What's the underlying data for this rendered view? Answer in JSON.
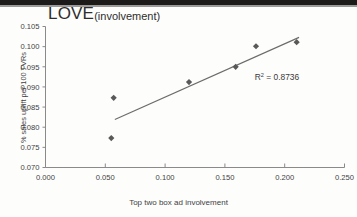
{
  "figure": {
    "title_main": "LOVE",
    "title_sub": "(involvement)",
    "annotation_r2_label": "R",
    "annotation_r2_exponent": "2",
    "annotation_r2_value": " = 0.8736",
    "marker_color": "#595959",
    "trendline_color": "#6b6b6b",
    "axis_color": "#8a8a8a",
    "text_color": "#3f3f3f"
  },
  "chart_data": {
    "type": "scatter",
    "xlabel": "Top two box ad involvement",
    "ylabel": "% sales uplift per 100 TVRs",
    "xlim": [
      0.0,
      0.25
    ],
    "ylim": [
      0.07,
      0.105
    ],
    "xticks": [
      "0.000",
      "0.050",
      "0.100",
      "0.150",
      "0.200",
      "0.250"
    ],
    "xtick_values": [
      0.0,
      0.05,
      0.1,
      0.15,
      0.2,
      0.25
    ],
    "yticks": [
      "0.070",
      "0.075",
      "0.080",
      "0.085",
      "0.090",
      "0.095",
      "0.100",
      "0.105"
    ],
    "ytick_values": [
      0.07,
      0.075,
      0.08,
      0.085,
      0.09,
      0.095,
      0.1,
      0.105
    ],
    "grid": false,
    "legend": null,
    "points": [
      {
        "x": 0.055,
        "y": 0.0773
      },
      {
        "x": 0.057,
        "y": 0.0873
      },
      {
        "x": 0.12,
        "y": 0.0912
      },
      {
        "x": 0.159,
        "y": 0.095
      },
      {
        "x": 0.176,
        "y": 0.1001
      },
      {
        "x": 0.21,
        "y": 0.1011
      }
    ],
    "trendline": {
      "x_start": 0.058,
      "y_start": 0.0819,
      "x_end": 0.212,
      "y_end": 0.1023
    },
    "annotations": [
      {
        "text": "R² = 0.8736",
        "x": 0.175,
        "y": 0.0917
      }
    ]
  }
}
